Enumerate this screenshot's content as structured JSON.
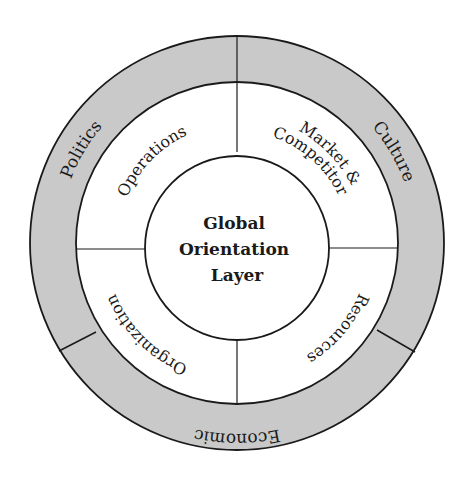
{
  "diagram": {
    "type": "concentric-ring-diagram",
    "colors": {
      "outer_ring_fill": "#c9c9c9",
      "middle_ring_fill": "#ffffff",
      "core_fill": "#ffffff",
      "stroke": "#1a1a1a"
    },
    "core": {
      "lines": [
        "Global",
        "Orientation",
        "Layer"
      ]
    },
    "middle_ring": {
      "segments": [
        {
          "label": "Operations",
          "position": "top-left"
        },
        {
          "label_lines": [
            "Market &",
            "Competitor"
          ],
          "position": "top-right"
        },
        {
          "label": "Resources",
          "position": "bottom-right"
        },
        {
          "label": "Organization",
          "position": "bottom-left"
        }
      ]
    },
    "outer_ring": {
      "segments": [
        {
          "label": "Politics",
          "position": "left"
        },
        {
          "label": "Culture",
          "position": "right"
        },
        {
          "label": "Economic",
          "position": "bottom"
        }
      ]
    }
  }
}
